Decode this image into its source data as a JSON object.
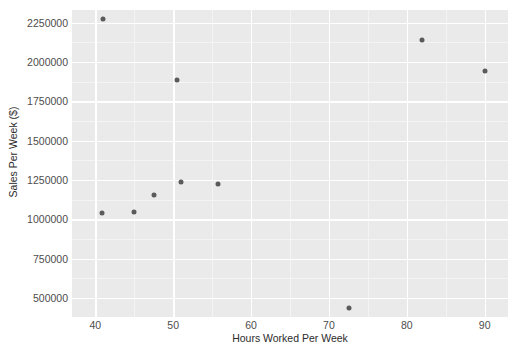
{
  "chart_data": {
    "type": "scatter",
    "title": "",
    "xlabel": "Hours Worked Per Week",
    "ylabel": "Sales Per Week ($)",
    "xlim": [
      37,
      93
    ],
    "ylim": [
      380000,
      2330000
    ],
    "xticks": [
      40,
      50,
      60,
      70,
      80,
      90
    ],
    "xtick_labels": [
      "40",
      "50",
      "60",
      "70",
      "80",
      "90"
    ],
    "yticks": [
      500000,
      750000,
      1000000,
      1250000,
      1500000,
      1750000,
      2000000,
      2250000
    ],
    "ytick_labels": [
      "500000",
      "750000",
      "1000000",
      "1250000",
      "1500000",
      "1750000",
      "2000000",
      "2250000"
    ],
    "grid": true,
    "legend": null,
    "panel_color": "#eaeaea",
    "grid_color": "#ffffff",
    "point_color": "#5b5b5b",
    "points": [
      {
        "x": 41,
        "y": 2270000
      },
      {
        "x": 40.8,
        "y": 1040000
      },
      {
        "x": 45,
        "y": 1047000
      },
      {
        "x": 47.5,
        "y": 1157000
      },
      {
        "x": 50.5,
        "y": 1888000
      },
      {
        "x": 51,
        "y": 1235000
      },
      {
        "x": 55.8,
        "y": 1225000
      },
      {
        "x": 72.6,
        "y": 440000
      },
      {
        "x": 82,
        "y": 2140000
      },
      {
        "x": 90,
        "y": 1945000
      }
    ],
    "n_points": 10
  }
}
